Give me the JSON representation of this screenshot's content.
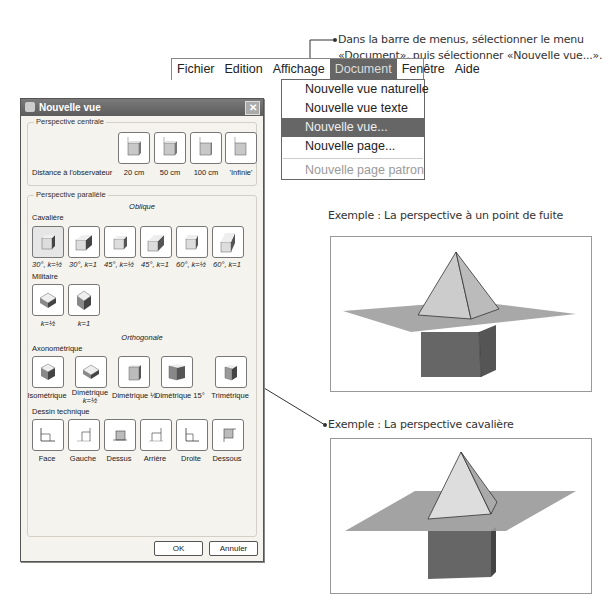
{
  "instructions": {
    "menu_note_line1": "Dans la barre de menus, sélectionner le menu",
    "menu_note_line2": "«Document», puis sélectionner «Nouvelle vue...»."
  },
  "menubar": {
    "items": [
      "Fichier",
      "Edition",
      "Affichage",
      "Document",
      "Fenêtre",
      "Aide"
    ],
    "active": "Document"
  },
  "document_menu": {
    "items": [
      {
        "label": "Nouvelle vue naturelle",
        "state": "normal"
      },
      {
        "label": "Nouvelle vue texte",
        "state": "normal"
      },
      {
        "label": "Nouvelle vue...",
        "state": "selected"
      },
      {
        "label": "Nouvelle page...",
        "state": "normal"
      },
      {
        "label": "Nouvelle page patron",
        "state": "disabled"
      }
    ]
  },
  "dialog": {
    "title": "Nouvelle vue",
    "close_icon": "close-icon",
    "perspective_centrale": {
      "label": "Perspective centrale",
      "distance_label": "Distance à l'observateur",
      "options": [
        "20 cm",
        "50 cm",
        "100 cm",
        "'Infinie'"
      ]
    },
    "perspective_parallele": {
      "label": "Perspective parallèle",
      "oblique_heading": "Oblique",
      "cavaliere": {
        "label": "Cavalière",
        "options": [
          "30°, k=½",
          "30°, k=1",
          "45°, k=½",
          "45°, k=1",
          "60°, k=½",
          "60°, k=1"
        ],
        "selected_index": 0
      },
      "militaire": {
        "label": "Militaire",
        "options": [
          "k=½",
          "k=1"
        ]
      },
      "orthogonale_heading": "Orthogonale",
      "axonometrique": {
        "label": "Axonométrique",
        "options": [
          "Isométrique",
          "Dimétrique k=½",
          "Dimétrique ½",
          "Dimétrique 15°",
          "Trimétrique"
        ],
        "option_line1": [
          "Isométrique",
          "Dimétrique",
          "Dimétrique ½",
          "Dimétrique 15°",
          "Trimétrique"
        ],
        "option_line2": [
          "",
          "k=½",
          "",
          "",
          ""
        ]
      },
      "dessin_technique": {
        "label": "Dessin technique",
        "options": [
          "Face",
          "Gauche",
          "Dessus",
          "Arrière",
          "Droite",
          "Dessous"
        ]
      }
    },
    "ok_label": "OK",
    "cancel_label": "Annuler"
  },
  "examples": {
    "one_point": "Exemple : La perspective à un point de fuite",
    "cavaliere": "Exemple : La perspective cavalière"
  }
}
